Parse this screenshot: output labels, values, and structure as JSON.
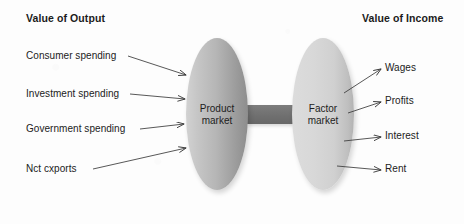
{
  "figure": {
    "type": "circular-flow-diagram",
    "background_color": "#fdfdfd",
    "headings": {
      "left": "Value of Output",
      "right": "Value of Income"
    },
    "nodes": [
      {
        "id": "product-market",
        "label_line1": "Product",
        "label_line2": "market",
        "shape": "ellipse",
        "fill_light": "#d2d2d2",
        "fill_dark": "#8d8d8d"
      },
      {
        "id": "factor-market",
        "label_line1": "Factor",
        "label_line2": "market",
        "shape": "ellipse",
        "fill_light": "#dcdcdc",
        "fill_dark": "#b2b2b2"
      }
    ],
    "connector": {
      "name": "market-connector-bar",
      "color": "#737373"
    },
    "inflows": [
      {
        "label": "Consumer spending"
      },
      {
        "label": "Investment spending"
      },
      {
        "label": "Government spending"
      },
      {
        "label": "Nct cxports"
      }
    ],
    "outflows": [
      {
        "label": "Wages"
      },
      {
        "label": "Profits"
      },
      {
        "label": "Interest"
      },
      {
        "label": "Rent"
      }
    ],
    "arrow_color": "#3a3a3a"
  }
}
